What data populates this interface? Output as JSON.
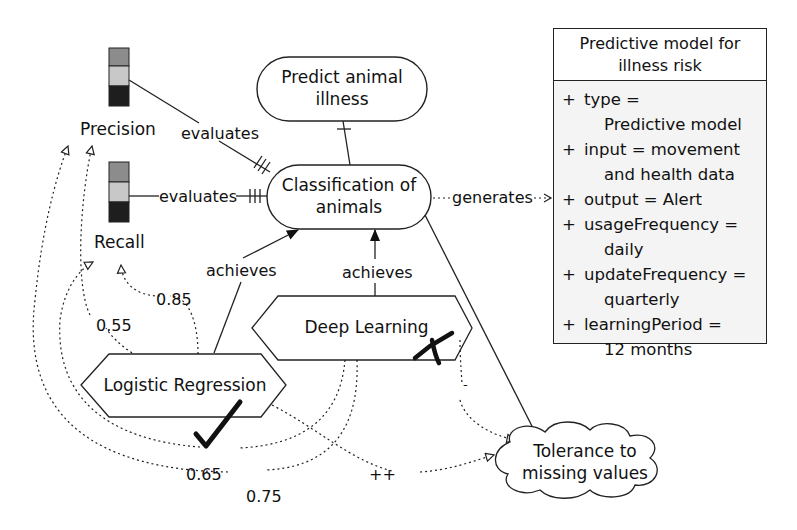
{
  "diagram": {
    "goal": {
      "line1": "Predict animal",
      "line2": "illness"
    },
    "task": {
      "line1": "Classification of",
      "line2": "animals"
    },
    "qualities": [
      {
        "id": "precision",
        "label": "Precision"
      },
      {
        "id": "recall",
        "label": "Recall"
      }
    ],
    "edges": {
      "evaluates_precision": "evaluates",
      "evaluates_recall": "evaluates",
      "generates": "generates",
      "achieves_lr": "achieves",
      "achieves_dl": "achieves",
      "contrib_plus_plus": "++",
      "contrib_minus": "-"
    },
    "algorithms": [
      {
        "id": "logistic-regression",
        "label": "Logistic Regression",
        "mark": "check"
      },
      {
        "id": "deep-learning",
        "label": "Deep Learning",
        "mark": "cross"
      }
    ],
    "softgoal": {
      "line1": "Tolerance to",
      "line2": "missing values"
    },
    "weights": {
      "lr_recall": "0.85",
      "lr_precision": "0.55",
      "dl_recall": "0.65",
      "dl_precision": "0.75"
    },
    "model_class": {
      "title_line1": "Predictive model for",
      "title_line2": "illness risk",
      "attributes": [
        {
          "line1": "type =",
          "line2": "Predictive model"
        },
        {
          "line1": "input = movement",
          "line2": "and health data"
        },
        {
          "line1": "output = Alert",
          "line2": ""
        },
        {
          "line1": "usageFrequency =",
          "line2": "daily"
        },
        {
          "line1": "updateFrequency =",
          "line2": "quarterly"
        },
        {
          "line1": "learningPeriod =",
          "line2": "12 months"
        }
      ]
    },
    "indicator_colors": {
      "top": "#8c8c8c",
      "middle": "#c8c8c8",
      "bottom": "#1e1e1e"
    }
  }
}
